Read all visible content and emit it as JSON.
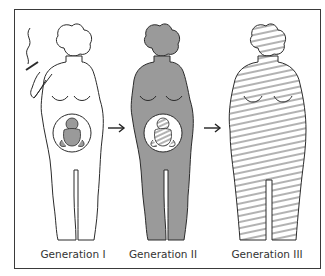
{
  "figure": {
    "type": "illustration",
    "arrows": [
      "arrow-right-icon",
      "arrow-right-icon"
    ],
    "colors": {
      "outline": "#2b2b2b",
      "gen2_fill": "#9a9a9a",
      "fetus_fill": "#9a9a9a",
      "hatch": "#555555",
      "frame_border": "#3a3a3a"
    }
  },
  "generations": [
    {
      "label": "Generation I",
      "style": "outline",
      "holds_cigarette": true,
      "fetus_style": "gray"
    },
    {
      "label": "Generation II",
      "style": "gray-fill",
      "fetus_style": "hatched"
    },
    {
      "label": "Generation III",
      "style": "hatched",
      "body_type": "obese"
    }
  ]
}
